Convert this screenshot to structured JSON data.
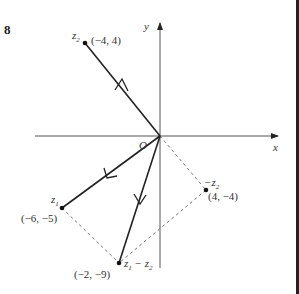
{
  "problem_number": "8",
  "axes": {
    "x_label": "x",
    "y_label": "y",
    "origin_label": "O"
  },
  "points": {
    "z2": {
      "name": "z",
      "sub": "2",
      "coord": "(−4, 4)"
    },
    "z1": {
      "name": "z",
      "sub": "1",
      "coord": "(−6, −5)"
    },
    "neg_z2": {
      "name": "−z",
      "sub": "2",
      "coord": "(4, −4)"
    },
    "diff": {
      "name": "z",
      "sub": "1",
      "minus": " − z",
      "sub2": "2",
      "coord": "(−2, −9)"
    }
  },
  "colors": {
    "line": "#222222",
    "axis": "#555555",
    "dashed": "#777777",
    "right_bar": "#222222"
  }
}
